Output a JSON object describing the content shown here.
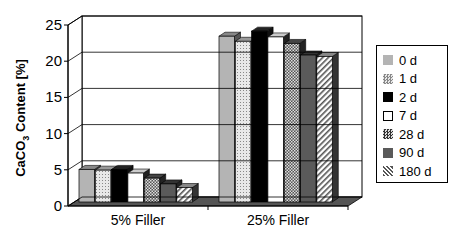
{
  "chart_data": {
    "type": "bar",
    "style": "3d-clustered",
    "title": "",
    "xlabel": "",
    "ylabel": "CaCO3 Content [%]",
    "ylim": [
      0,
      25
    ],
    "yticks": [
      "0",
      "5",
      "10",
      "15",
      "20",
      "25"
    ],
    "grid": true,
    "legend_position": "right",
    "categories": [
      "5% Filler",
      "25% Filler"
    ],
    "series": [
      {
        "name": "0 d",
        "values": [
          4.5,
          22.9
        ],
        "color": "#b0b0b0",
        "pattern": "solid-light"
      },
      {
        "name": "1 d",
        "values": [
          4.4,
          22.2
        ],
        "color": "#d8d8d8",
        "pattern": "dotted"
      },
      {
        "name": "2 d",
        "values": [
          4.5,
          23.6
        ],
        "color": "#000000",
        "pattern": "solid-black"
      },
      {
        "name": "7 d",
        "values": [
          4.0,
          22.8
        ],
        "color": "#ffffff",
        "pattern": "white"
      },
      {
        "name": "28 d",
        "values": [
          3.3,
          21.9
        ],
        "color": "#808080",
        "pattern": "checker"
      },
      {
        "name": "90 d",
        "values": [
          2.5,
          20.3
        ],
        "color": "#606060",
        "pattern": "solid-dark"
      },
      {
        "name": "180 d",
        "values": [
          2.0,
          20.1
        ],
        "color": "#c8c8c8",
        "pattern": "diagonal"
      }
    ]
  },
  "axis": {
    "ylabel_main": "CaCO",
    "ylabel_sub": "3",
    "ylabel_rest": " Content [%]"
  },
  "legend": {
    "items": [
      "0 d",
      "1 d",
      "2 d",
      "7 d",
      "28 d",
      "90 d",
      "180 d"
    ]
  }
}
